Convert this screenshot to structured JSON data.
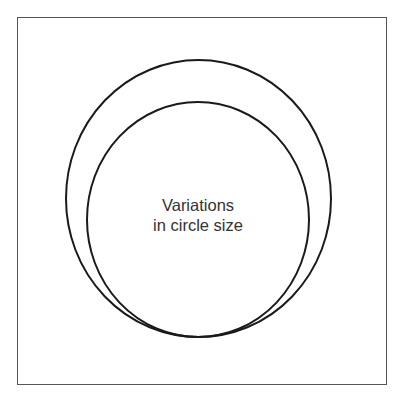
{
  "diagram": {
    "title_lines": [
      "Variations",
      "in circle size"
    ],
    "shapes": [
      {
        "name": "outer-circle",
        "cx": 198.5,
        "cy": 198.5,
        "rx": 132.5,
        "ry": 138.5
      },
      {
        "name": "inner-circle",
        "cx": 198,
        "cy": 219.5,
        "rx": 111,
        "ry": 117.5
      }
    ],
    "colors": {
      "stroke": "#1a1a1a",
      "frame": "#555555",
      "text": "#333333",
      "background": "#ffffff"
    }
  }
}
